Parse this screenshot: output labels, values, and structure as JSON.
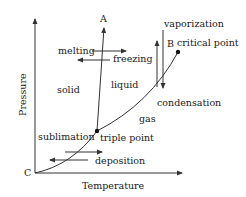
{
  "diagram": {
    "type": "phase-diagram",
    "axes": {
      "x_label": "Temperature",
      "y_label": "Pressure",
      "origin_label": "C"
    },
    "points": {
      "top_label": "A",
      "critical_label": "B",
      "critical_point": "critical point",
      "triple_point": "triple point"
    },
    "regions": {
      "solid": "solid",
      "liquid": "liquid",
      "gas": "gas"
    },
    "transitions": {
      "melting": "melting",
      "freezing": "freezing",
      "vaporization": "vaporization",
      "condensation": "condensation",
      "sublimation": "sublimation",
      "deposition": "deposition"
    },
    "colors": {
      "line": "#333333",
      "text": "#1a1a1a",
      "background": "#ffffff"
    }
  }
}
